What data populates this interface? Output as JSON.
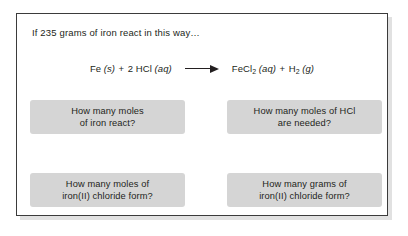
{
  "slide": {
    "prompt": "If 235 grams of iron react in this way…",
    "equation": {
      "reactants": [
        {
          "formula": "Fe",
          "state": "(s)"
        },
        {
          "coefficient": "2",
          "formula": "HCl",
          "state": "(aq)"
        }
      ],
      "products": [
        {
          "formula": "FeCl",
          "subscript": "2",
          "state": "(aq)"
        },
        {
          "formula": "H",
          "subscript": "2",
          "state": "(g)"
        }
      ],
      "plus": "+",
      "arrow": "right-arrow",
      "plain_text": "Fe (s) + 2 HCl (aq) → FeCl2 (aq) + H2 (g)"
    },
    "questions": [
      {
        "line1": "How many moles",
        "line2": "of iron react?"
      },
      {
        "line1": "How many moles of HCl",
        "line2": "are needed?"
      },
      {
        "line1": "How many moles of",
        "line2": "iron(II) chloride form?"
      },
      {
        "line1": "How many grams of",
        "line2": "iron(II) chloride form?"
      }
    ]
  },
  "colors": {
    "page_background": "#ffffff",
    "panel_border": "#3b3b3b",
    "box_fill": "#d5d5d5",
    "text": "#231f20",
    "shadow": "#c9c9c9"
  }
}
